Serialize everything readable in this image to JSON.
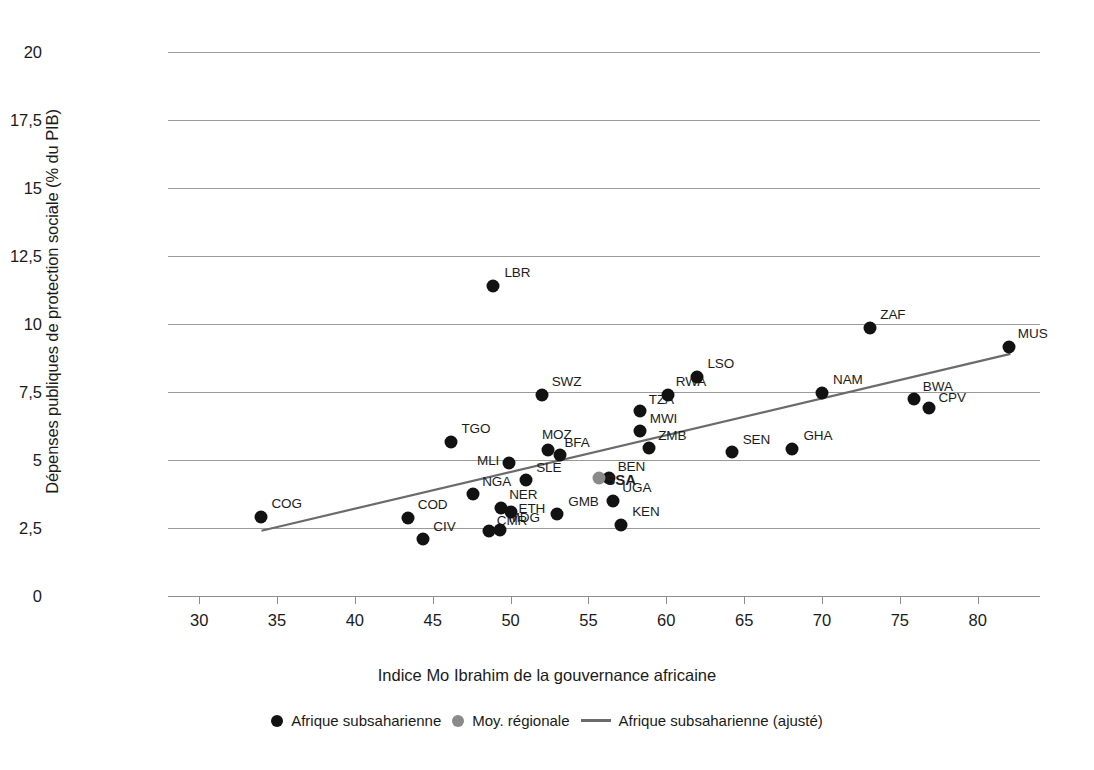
{
  "chart_data": {
    "type": "scatter",
    "title": "",
    "xlabel": "Indice Mo Ibrahim de la gouvernance africaine",
    "ylabel": "Dépenses publiques de protection sociale (% du PIB)",
    "xlim": [
      28,
      84
    ],
    "ylim": [
      0,
      20
    ],
    "xticks": [
      30,
      35,
      40,
      45,
      50,
      55,
      60,
      65,
      70,
      75,
      80
    ],
    "xticklabels": [
      "30",
      "35",
      "40",
      "45",
      "50",
      "55",
      "60",
      "65",
      "70",
      "75",
      "80"
    ],
    "yticks": [
      0,
      2.5,
      5,
      7.5,
      10,
      12.5,
      15,
      17.5,
      20
    ],
    "yticklabels": [
      "0",
      "2,5",
      "5",
      "7,5",
      "10",
      "12,5",
      "15",
      "17,5",
      "20"
    ],
    "grid": "horizontal",
    "legend_position": "bottom",
    "series": [
      {
        "name": "Afrique subsaharienne",
        "type": "scatter",
        "color": "#121212",
        "points": [
          {
            "label": "COG",
            "x": 34.0,
            "y": 2.9,
            "lx": 10,
            "ly": -14
          },
          {
            "label": "COD",
            "x": 43.4,
            "y": 2.85,
            "lx": 10,
            "ly": -14
          },
          {
            "label": "CIV",
            "x": 44.4,
            "y": 2.1,
            "lx": 10,
            "ly": -13
          },
          {
            "label": "TGO",
            "x": 46.2,
            "y": 5.65,
            "lx": 10,
            "ly": -14
          },
          {
            "label": "NGA",
            "x": 47.6,
            "y": 3.75,
            "lx": 9,
            "ly": -13
          },
          {
            "label": "CMR",
            "x": 48.6,
            "y": 2.4,
            "lx": 8,
            "ly": -11
          },
          {
            "label": "MDG",
            "x": 49.3,
            "y": 2.42,
            "lx": 9,
            "ly": -13
          },
          {
            "label": "LBR",
            "x": 48.9,
            "y": 11.4,
            "lx": 11,
            "ly": -14
          },
          {
            "label": "MLI",
            "x": 49.9,
            "y": 4.9,
            "lx": -32,
            "ly": -3
          },
          {
            "label": "NER",
            "x": 49.4,
            "y": 3.25,
            "lx": 8,
            "ly": -14
          },
          {
            "label": "ETH",
            "x": 50.0,
            "y": 3.1,
            "lx": 8,
            "ly": -4
          },
          {
            "label": "SLE",
            "x": 51.0,
            "y": 4.25,
            "lx": 10,
            "ly": -13
          },
          {
            "label": "SWZ",
            "x": 52.0,
            "y": 7.4,
            "lx": 10,
            "ly": -14
          },
          {
            "label": "MOZ",
            "x": 52.4,
            "y": 5.35,
            "lx": -6,
            "ly": -16
          },
          {
            "label": "BFA",
            "x": 53.2,
            "y": 5.2,
            "lx": 4,
            "ly": -13
          },
          {
            "label": "GMB",
            "x": 53.0,
            "y": 3.0,
            "lx": 11,
            "ly": -13
          },
          {
            "label": "BEN",
            "x": 56.3,
            "y": 4.35,
            "lx": 9,
            "ly": -12
          },
          {
            "label": "UGA",
            "x": 56.6,
            "y": 3.5,
            "lx": 9,
            "ly": -14
          },
          {
            "label": "KEN",
            "x": 57.1,
            "y": 2.6,
            "lx": 11,
            "ly": -14
          },
          {
            "label": "TZA",
            "x": 58.3,
            "y": 6.8,
            "lx": 9,
            "ly": -12
          },
          {
            "label": "MWI",
            "x": 58.3,
            "y": 6.05,
            "lx": 10,
            "ly": -13
          },
          {
            "label": "ZMB",
            "x": 58.9,
            "y": 5.45,
            "lx": 9,
            "ly": -13
          },
          {
            "label": "RWA",
            "x": 60.1,
            "y": 7.4,
            "lx": 8,
            "ly": -14
          },
          {
            "label": "LSO",
            "x": 62.0,
            "y": 8.05,
            "lx": 10,
            "ly": -14
          },
          {
            "label": "SEN",
            "x": 64.2,
            "y": 5.3,
            "lx": 11,
            "ly": -13
          },
          {
            "label": "GHA",
            "x": 68.1,
            "y": 5.4,
            "lx": 11,
            "ly": -14
          },
          {
            "label": "NAM",
            "x": 70.0,
            "y": 7.45,
            "lx": 11,
            "ly": -14
          },
          {
            "label": "BWA",
            "x": 75.9,
            "y": 7.25,
            "lx": 9,
            "ly": -13
          },
          {
            "label": "CPV",
            "x": 76.9,
            "y": 6.9,
            "lx": 9,
            "ly": -11
          },
          {
            "label": "ZAF",
            "x": 73.1,
            "y": 9.85,
            "lx": 10,
            "ly": -14
          },
          {
            "label": "MUS",
            "x": 82.0,
            "y": 9.15,
            "lx": 9,
            "ly": -14
          }
        ]
      },
      {
        "name": "Moy. régionale",
        "type": "scatter",
        "color": "#8a8a8a",
        "points": [
          {
            "label": "SSA",
            "x": 55.7,
            "y": 4.35,
            "lx": 6,
            "ly": 1
          }
        ]
      },
      {
        "name": "Afrique subsaharienne (ajusté)",
        "type": "line",
        "color": "#6b6b6b",
        "x": [
          34.0,
          82.1
        ],
        "y": [
          2.4,
          8.9
        ]
      }
    ]
  },
  "legend": {
    "items": [
      {
        "marker": "dot-black",
        "label": "Afrique subsaharienne"
      },
      {
        "marker": "dot-grey",
        "label": "Moy. régionale"
      },
      {
        "marker": "line",
        "label": "Afrique subsaharienne (ajusté)"
      }
    ]
  }
}
